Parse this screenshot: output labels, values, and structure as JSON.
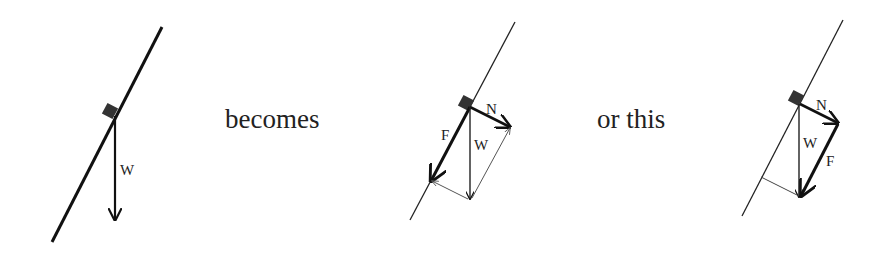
{
  "labels": {
    "becomes": "becomes",
    "or_this": "or this"
  },
  "diagram1": {
    "weight_label": "W"
  },
  "diagram2": {
    "normal_label": "N",
    "weight_label": "W",
    "friction_label": "F"
  },
  "diagram3": {
    "normal_label": "N",
    "weight_label": "W",
    "friction_label": "F"
  },
  "colors": {
    "line": "#111111",
    "block": "#333333",
    "text": "#222222"
  }
}
